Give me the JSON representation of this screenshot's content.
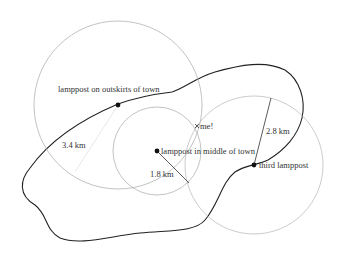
{
  "diagram": {
    "type": "trilateration",
    "colors": {
      "circle": "#a8a8a8",
      "boundary": "#222222",
      "radius_line": "#333333",
      "faint_radius_line": "#e2e2e2",
      "dot": "#111111",
      "text": "#333333"
    },
    "lampposts": [
      {
        "label": "lamppost on outskirts of town",
        "distance": "3.4 km"
      },
      {
        "label": "lamppost in middle of town",
        "distance": "1.8 km"
      },
      {
        "label": "third lamppost",
        "distance": "2.8 km"
      }
    ],
    "position_marker": {
      "label": "me!"
    }
  }
}
